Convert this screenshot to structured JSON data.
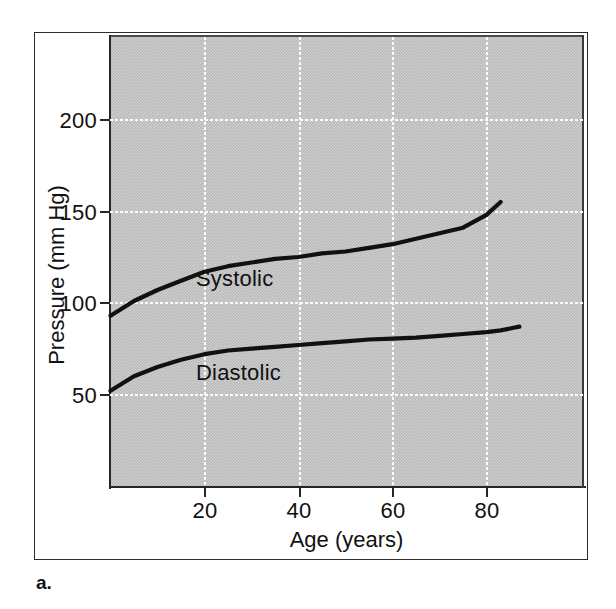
{
  "figure": {
    "caption": "a."
  },
  "chart_data": {
    "type": "line",
    "title": "",
    "xlabel": "Age (years)",
    "ylabel": "Pressure (mm Hg)",
    "xlim": [
      0,
      100
    ],
    "ylim": [
      0,
      230
    ],
    "xticks": [
      "20",
      "40",
      "60",
      "80"
    ],
    "xtick_values": [
      20,
      40,
      60,
      80
    ],
    "yticks": [
      "50",
      "100",
      "150",
      "200"
    ],
    "ytick_values": [
      50,
      100,
      150,
      200
    ],
    "grid": true,
    "legend_position": "inline-labels",
    "plot_background": "#b9b9b9",
    "line_color": "#111111",
    "x": [
      0,
      5,
      10,
      15,
      20,
      25,
      30,
      35,
      40,
      45,
      50,
      55,
      60,
      65,
      70,
      75,
      80,
      83,
      85,
      87
    ],
    "series": [
      {
        "name": "Systolic",
        "label": "Systolic",
        "values": [
          93,
          101,
          107,
          112,
          117,
          120,
          122,
          124,
          125,
          127,
          128,
          130,
          132,
          135,
          138,
          141,
          148,
          155,
          null,
          null
        ]
      },
      {
        "name": "Diastolic",
        "label": "Diastolic",
        "values": [
          52,
          60,
          65,
          69,
          72,
          74,
          75,
          76,
          77,
          78,
          79,
          80,
          80.5,
          81,
          82,
          83,
          84,
          85,
          86,
          87
        ]
      }
    ]
  }
}
